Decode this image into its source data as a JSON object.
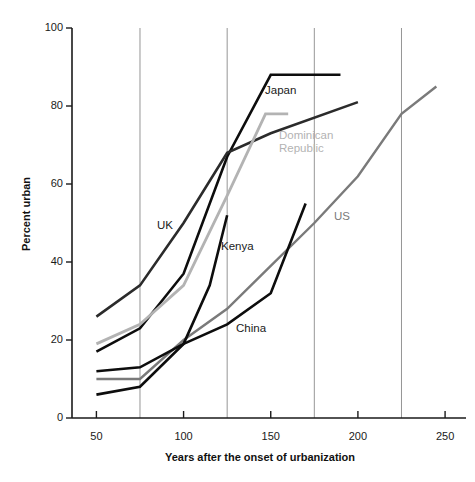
{
  "chart_data": {
    "type": "line",
    "title": "",
    "xlabel": "Years after the onset of urbanization",
    "ylabel": "Percent urban",
    "xlim": [
      36,
      262
    ],
    "ylim": [
      0,
      100
    ],
    "xticks": [
      50,
      100,
      150,
      200,
      250
    ],
    "yticks": [
      0,
      20,
      40,
      60,
      80,
      100
    ],
    "gridlines_x": [
      75,
      125,
      175,
      225
    ],
    "grid": "vertical-only",
    "legend": "inline-labels",
    "series": [
      {
        "name": "Japan",
        "color": "#0d0d0d",
        "width": 2.6,
        "x": [
          50,
          75,
          100,
          125,
          150,
          190
        ],
        "values": [
          17,
          23,
          37,
          67,
          88,
          88
        ],
        "label_x": 265,
        "label_y": 84
      },
      {
        "name": "UK",
        "color": "#2b2b2b",
        "width": 2.6,
        "x": [
          50,
          75,
          100,
          125,
          150,
          200
        ],
        "values": [
          26,
          34,
          50,
          68,
          73,
          81
        ],
        "label_x": 157,
        "label_y": 219
      },
      {
        "name": "Dominican Republic",
        "color": "#b3b3b3",
        "width": 2.8,
        "x": [
          50,
          75,
          100,
          125,
          147,
          160
        ],
        "values": [
          19,
          24,
          34,
          57,
          78,
          78
        ],
        "label_x": 279,
        "label_y": 129
      },
      {
        "name": "US",
        "color": "#7a7a7a",
        "width": 2.4,
        "x": [
          50,
          75,
          100,
          125,
          150,
          175,
          200,
          225,
          245
        ],
        "values": [
          10,
          10,
          20,
          28,
          39,
          50,
          62,
          78,
          85
        ],
        "label_x": 334,
        "label_y": 210
      },
      {
        "name": "Kenya",
        "color": "#0d0d0d",
        "width": 2.6,
        "x": [
          50,
          75,
          100,
          115,
          125
        ],
        "values": [
          6,
          8,
          19,
          34,
          52
        ],
        "label_x": 221,
        "label_y": 240
      },
      {
        "name": "China",
        "color": "#0d0d0d",
        "width": 2.6,
        "x": [
          50,
          75,
          100,
          125,
          150,
          170
        ],
        "values": [
          12,
          13,
          19,
          24,
          32,
          55
        ],
        "label_x": 236,
        "label_y": 322
      }
    ]
  },
  "axes": {
    "y_title": "Percent urban",
    "x_title": "Years after the onset of urbanization",
    "y_tick_labels": [
      "100",
      "80",
      "60",
      "40",
      "20",
      "0"
    ],
    "x_tick_labels": [
      "50",
      "100",
      "150",
      "200",
      "250"
    ]
  }
}
